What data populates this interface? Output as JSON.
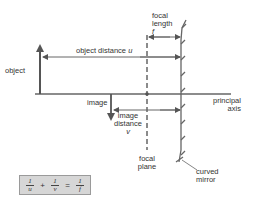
{
  "diagram": {
    "labels": {
      "object": "object",
      "object_distance": "object distance",
      "object_distance_symbol": "u",
      "focal_length_line1": "focal",
      "focal_length_line2": "length",
      "focal_length_symbol": "f",
      "image": "image",
      "image_distance_line1": "image",
      "image_distance_line2": "distance",
      "image_distance_symbol": "v",
      "principal_axis_line1": "principal",
      "principal_axis_line2": "axis",
      "focal_plane_line1": "focal",
      "focal_plane_line2": "plane",
      "curved_mirror_line1": "curved",
      "curved_mirror_line2": "mirror"
    },
    "equation": {
      "term1_num": "1",
      "term1_den": "u",
      "plus": "+",
      "term2_num": "1",
      "term2_den": "v",
      "equals": "=",
      "term3_num": "1",
      "term3_den": "f"
    },
    "colors": {
      "line": "#555555",
      "text": "#333333",
      "equation_box": "#d6d6d6"
    }
  }
}
